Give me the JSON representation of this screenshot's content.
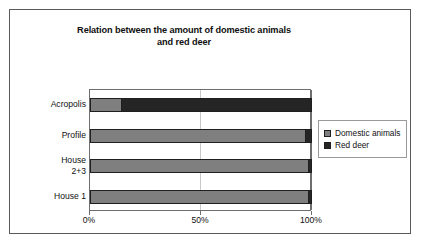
{
  "chart_data": {
    "type": "bar",
    "orientation": "horizontal",
    "stacked": true,
    "normalized_percent": true,
    "title": "Relation between the amount of domestic animals\nand red deer",
    "xlabel": "",
    "ylabel": "",
    "xlim": [
      0,
      100
    ],
    "xticks": [
      0,
      50,
      100
    ],
    "xtick_labels": [
      "0%",
      "50%",
      "100%"
    ],
    "grid": true,
    "grid_axis": "x",
    "legend_position": "right",
    "categories": [
      "Acropolis",
      "Profile",
      "House\n2+3",
      "House 1"
    ],
    "category_order_top_to_bottom": [
      "Acropolis",
      "Profile",
      "House\n2+3",
      "House 1"
    ],
    "series": [
      {
        "name": "Domestic animals",
        "color": "#7f7f7f",
        "values": [
          14,
          97,
          98,
          98
        ]
      },
      {
        "name": "Red deer",
        "color": "#252525",
        "values": [
          86,
          3,
          2,
          2
        ]
      }
    ]
  },
  "figure": {
    "title": "Relation between the amount of domestic animals\nand red deer",
    "legend": {
      "items": [
        {
          "label": "Domestic animals",
          "swatch": "legend-swatch-domestic-animals"
        },
        {
          "label": "Red deer",
          "swatch": "legend-swatch-red-deer"
        }
      ]
    },
    "axis": {
      "x_tick_labels": [
        "0%",
        "50%",
        "100%"
      ],
      "y_tick_labels": [
        "Acropolis",
        "Profile",
        "House\n2+3",
        "House 1"
      ]
    },
    "colors": {
      "domestic_animals": "#7f7f7f",
      "red_deer": "#252525",
      "frame": "#5a5a5a",
      "plot_border": "#6e6e6e",
      "gridline": "#c9c9c9",
      "background": "#ffffff"
    }
  }
}
